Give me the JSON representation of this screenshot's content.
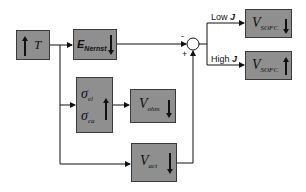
{
  "diagram": {
    "blocks": {
      "temperature": {
        "symbol": "T",
        "trend": "up"
      },
      "nernst": {
        "symbol": "E",
        "subscript": "Nernst",
        "trend": "down"
      },
      "conductivity": {
        "symbol_1": "σ",
        "subscript_1": "el",
        "symbol_2": "σ",
        "subscript_2": "ca",
        "trend": "up"
      },
      "ohmic": {
        "symbol": "V",
        "subscript": "ohm",
        "trend": "down"
      },
      "activation": {
        "symbol": "V",
        "subscript": "act",
        "trend": "down"
      },
      "vsofc_low": {
        "symbol": "V",
        "subscript": "SOFC",
        "trend": "down"
      },
      "vsofc_high": {
        "symbol": "V",
        "subscript": "SOFC",
        "trend": "up"
      }
    },
    "summing_junction": {
      "minus_sign": "-",
      "plus_sign": "+"
    },
    "branches": {
      "low": {
        "label": "Low",
        "variable": "J"
      },
      "high": {
        "label": "High",
        "variable": "J"
      }
    },
    "colors": {
      "block_fill": "#8f8f8f",
      "line": "#111111"
    }
  }
}
